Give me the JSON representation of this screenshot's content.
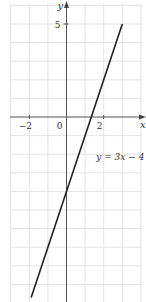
{
  "chart_data": {
    "type": "line",
    "title": "",
    "xlabel": "x",
    "ylabel": "y",
    "xlim": [
      -3.3,
      4.2
    ],
    "ylim": [
      -9.8,
      6.2
    ],
    "grid": true,
    "x_ticks": [
      {
        "value": -2,
        "label": "−2"
      },
      {
        "value": 0,
        "label": "0"
      },
      {
        "value": 2,
        "label": "2"
      }
    ],
    "y_ticks": [
      {
        "value": 5,
        "label": "5"
      }
    ],
    "series": [
      {
        "name": "y = 3x − 4",
        "equation": "y = 3x − 4",
        "slope": 3,
        "intercept": -4,
        "x": [
          -1.9,
          3
        ],
        "y": [
          -9.7,
          5
        ]
      }
    ],
    "annotations": [
      {
        "text": "y = 3x − 4",
        "x": 1.6,
        "y": -2.3
      }
    ]
  },
  "colors": {
    "grid": "#e4e4e4",
    "axis": "#555555",
    "line": "#222222",
    "text": "#333333"
  },
  "labels": {
    "x_axis": "x",
    "y_axis": "y",
    "origin": "0",
    "equation": "y = 3x − 4"
  }
}
